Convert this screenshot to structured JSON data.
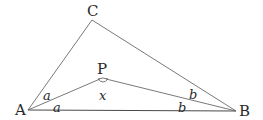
{
  "diagram": {
    "type": "geometry-triangle",
    "points": {
      "A": {
        "label": "A",
        "x": 28,
        "y": 110
      },
      "B": {
        "label": "B",
        "x": 236,
        "y": 111
      },
      "C": {
        "label": "C",
        "x": 92,
        "y": 20
      },
      "P": {
        "label": "P",
        "x": 102,
        "y": 78
      }
    },
    "segments": [
      "AC",
      "CB",
      "AB",
      "AP",
      "PB"
    ],
    "angle_labels": {
      "a_upper": "a",
      "a_lower": "a",
      "x": "x",
      "b_upper": "b",
      "b_lower": "b"
    },
    "colors": {
      "line": "#6a6a6a",
      "text": "#2a2a2a",
      "background": "#ffffff"
    }
  }
}
